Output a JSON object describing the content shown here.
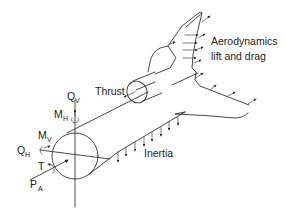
{
  "diagram": {
    "labels": {
      "aero_line1": "Aerodynamics",
      "aero_line2": "lift and drag",
      "thrust": "Thrust",
      "inertia": "Inertia",
      "qv_main": "Q",
      "qv_sub": "V",
      "mh_main": "M",
      "mh_sub": "H",
      "mv_main": "M",
      "mv_sub": "V",
      "qh_main": "Q",
      "qh_sub": "H",
      "t_main": "T",
      "pa_main": "P",
      "pa_sub": "A"
    },
    "colors": {
      "line": "#333333",
      "text": "#222222",
      "background": "#ffffff"
    }
  }
}
